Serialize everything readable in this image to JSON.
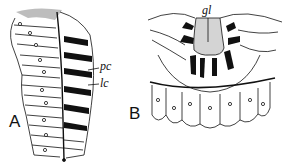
{
  "figure": {
    "panels": [
      {
        "id": "A",
        "label": "A",
        "annotations": [
          {
            "label": "pc"
          },
          {
            "label": "lc"
          }
        ]
      },
      {
        "id": "B",
        "label": "B",
        "annotations": [
          {
            "label": "gl"
          }
        ]
      }
    ],
    "colors": {
      "ink": "#111111",
      "background": "#ffffff",
      "stipple": "#9a9a9a"
    }
  }
}
